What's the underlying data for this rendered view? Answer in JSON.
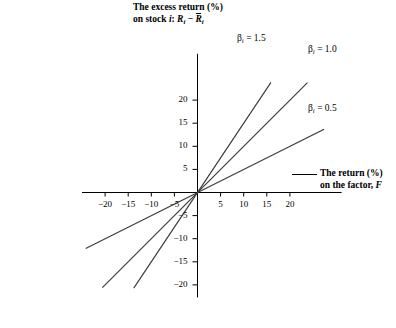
{
  "chart_data": {
    "type": "line",
    "title": "",
    "ylabel_line1": "The excess return (%)",
    "ylabel_line2_prefix": "on stock ",
    "ylabel_line2_stock": "i",
    "ylabel_line2_colon": ": ",
    "ylabel_R": "R",
    "ylabel_sub_i": "i",
    "ylabel_minus": " − ",
    "ylabel_Rbar": "R",
    "xlabel_line1": "The return (%)",
    "xlabel_line2_prefix": "on the factor, ",
    "xlabel_line2_F": "F",
    "x_ticks": [
      -20,
      -15,
      -10,
      -5,
      5,
      10,
      15,
      20
    ],
    "x_tick_labels": [
      "−20",
      "−15",
      "−10",
      "−5",
      "5",
      "10",
      "15",
      "20"
    ],
    "y_ticks": [
      20,
      15,
      10,
      5,
      -5,
      -10,
      -15,
      -20
    ],
    "y_tick_labels": [
      "20",
      "15",
      "10",
      "5",
      "−5",
      "−10",
      "−15",
      "−20"
    ],
    "xlim": [
      -25,
      26
    ],
    "ylim": [
      -24,
      27
    ],
    "grid": false,
    "legend_position": "inline-at-line-ends",
    "axis_color": "#000000",
    "line_color": "#3a3a3a",
    "series": [
      {
        "name": "beta-1.5",
        "label_beta": "β",
        "label_sub": "i",
        "label_value": " = 1.5",
        "slope": 1.5,
        "x_start": -13.8,
        "x_end": 15.9,
        "label_x": 237,
        "label_y": 33
      },
      {
        "name": "beta-1.0",
        "label_beta": "β",
        "label_sub": "i",
        "label_value": " = 1.0",
        "slope": 1.0,
        "x_start": -20.6,
        "x_end": 23.8,
        "label_x": 308,
        "label_y": 44
      },
      {
        "name": "beta-0.5",
        "label_beta": "β",
        "label_sub": "i",
        "label_value": " = 0.5",
        "slope": 0.5,
        "x_start": -24.2,
        "x_end": 27.4,
        "label_x": 308,
        "label_y": 103
      }
    ]
  }
}
